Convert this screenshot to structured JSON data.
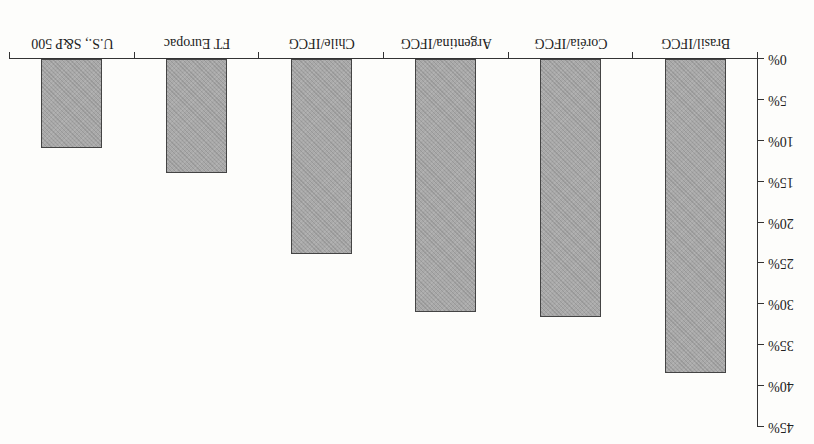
{
  "chart_data": {
    "type": "bar",
    "orientation_note": "scan displayed rotated 180 degrees",
    "title": "",
    "xlabel": "",
    "ylabel": "",
    "categories": [
      "Brasil/IFCG",
      "Coréia/IFCG",
      "Argentina/IFCG",
      "Chile/IFCG",
      "FT Europac",
      "U.S., S&P 500"
    ],
    "values": [
      38.4,
      31.5,
      30.9,
      23.8,
      13.9,
      10.9
    ],
    "value_unit": "%",
    "ylim": [
      0,
      45
    ],
    "yticks": [
      "0%",
      "5%",
      "10%",
      "15%",
      "20%",
      "25%",
      "30%",
      "35%",
      "40%",
      "45%"
    ],
    "grid": false,
    "legend": null,
    "bar_color": "#a9a9a9"
  }
}
